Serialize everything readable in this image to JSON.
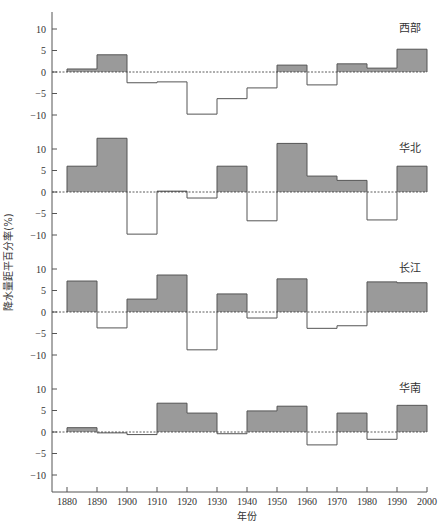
{
  "chart_data": {
    "type": "bar",
    "subtype": "step-histogram (decadal anomaly panels)",
    "xlabel": "年份",
    "ylabel": "降水量距平百分率(%)",
    "x_ticks": [
      1880,
      1890,
      1900,
      1910,
      1920,
      1930,
      1940,
      1950,
      1960,
      1970,
      1980,
      1990,
      2000
    ],
    "categories": [
      "1880s",
      "1890s",
      "1900s",
      "1910s",
      "1920s",
      "1930s",
      "1940s",
      "1950s",
      "1960s",
      "1970s",
      "1980s",
      "1990s"
    ],
    "y_ticks": [
      10,
      5,
      0,
      -5,
      -10
    ],
    "ylim": [
      -14,
      14
    ],
    "grid": false,
    "zero_line": "dashed",
    "positive_fill": "#9a9a9a",
    "negative_fill": "#ffffff",
    "line_color": "#555555",
    "series": [
      {
        "name": "西部",
        "values": [
          0.7,
          4.0,
          -2.5,
          -2.3,
          -9.8,
          -6.2,
          -3.7,
          1.6,
          -3.0,
          1.9,
          0.9,
          5.3
        ]
      },
      {
        "name": "华北",
        "values": [
          6.0,
          12.5,
          -9.8,
          0.2,
          -1.4,
          6.0,
          -6.7,
          11.3,
          3.7,
          2.7,
          -6.5,
          6.0
        ]
      },
      {
        "name": "长江",
        "values": [
          7.2,
          -3.7,
          3.0,
          8.6,
          -8.8,
          4.2,
          -1.4,
          7.7,
          -3.8,
          -3.2,
          7.0,
          6.8
        ]
      },
      {
        "name": "华南",
        "values": [
          1.0,
          -0.2,
          -0.6,
          6.7,
          4.4,
          -0.4,
          4.9,
          6.0,
          -3.0,
          4.4,
          -1.7,
          6.2
        ]
      }
    ]
  }
}
